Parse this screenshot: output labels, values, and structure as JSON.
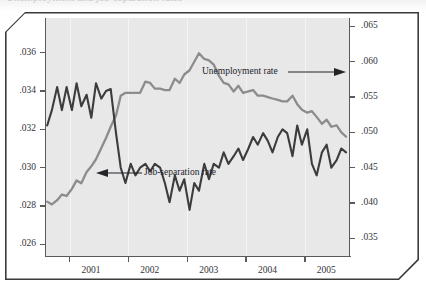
{
  "figure": {
    "clipped_caption": "Unemployment and job-separation rates"
  },
  "chart_data": {
    "type": "line",
    "title": "",
    "xlabel": "",
    "ylabel_left": "",
    "ylabel_right": "",
    "grid": "vertical",
    "legend_position": "inline-annotations",
    "x_tick_labels": [
      "2001",
      "2002",
      "2003",
      "2004",
      "2005"
    ],
    "x_tick_positions": [
      2001,
      2002,
      2003,
      2004,
      2005
    ],
    "xlim": [
      2000.6,
      2005.75
    ],
    "left_axis": {
      "tick_labels": [
        ".036",
        ".034",
        ".032",
        ".030",
        ".028",
        ".026"
      ],
      "tick_values": [
        0.036,
        0.034,
        0.032,
        0.03,
        0.028,
        0.026
      ],
      "ylim": [
        0.0254,
        0.0378
      ]
    },
    "right_axis": {
      "tick_labels": [
        ".065",
        ".060",
        ".055",
        ".050",
        ".045",
        ".040",
        ".035"
      ],
      "tick_values": [
        0.065,
        0.06,
        0.055,
        0.05,
        0.045,
        0.04,
        0.035
      ],
      "ylim": [
        0.0325,
        0.0662
      ]
    },
    "annotations": [
      {
        "text": "Unemployment rate",
        "arrow": "right"
      },
      {
        "text": "Job-separation rate",
        "arrow": "left"
      }
    ],
    "series": [
      {
        "name": "Unemployment rate",
        "axis": "right",
        "color": "#8c8c8c",
        "x": [
          2000.62,
          2000.7,
          2000.79,
          2000.87,
          2000.95,
          2001.04,
          2001.12,
          2001.2,
          2001.29,
          2001.37,
          2001.45,
          2001.54,
          2001.62,
          2001.7,
          2001.79,
          2001.87,
          2001.95,
          2002.04,
          2002.12,
          2002.2,
          2002.29,
          2002.37,
          2002.45,
          2002.54,
          2002.62,
          2002.7,
          2002.79,
          2002.87,
          2002.95,
          2003.04,
          2003.12,
          2003.2,
          2003.29,
          2003.37,
          2003.45,
          2003.54,
          2003.62,
          2003.7,
          2003.79,
          2003.87,
          2003.95,
          2004.04,
          2004.12,
          2004.2,
          2004.29,
          2004.37,
          2004.45,
          2004.54,
          2004.62,
          2004.7,
          2004.79,
          2004.87,
          2004.95,
          2005.04,
          2005.12,
          2005.2,
          2005.29,
          2005.37,
          2005.45,
          2005.54,
          2005.62,
          2005.7
        ],
        "y": [
          0.0402,
          0.0398,
          0.0404,
          0.0412,
          0.041,
          0.042,
          0.0432,
          0.0428,
          0.0444,
          0.0452,
          0.0462,
          0.0478,
          0.0492,
          0.0508,
          0.0524,
          0.0552,
          0.0556,
          0.0556,
          0.0556,
          0.0556,
          0.0572,
          0.057,
          0.0562,
          0.0562,
          0.056,
          0.056,
          0.0576,
          0.057,
          0.0582,
          0.0588,
          0.06,
          0.0612,
          0.0604,
          0.0602,
          0.0596,
          0.058,
          0.057,
          0.0568,
          0.0558,
          0.0566,
          0.0556,
          0.0558,
          0.056,
          0.0552,
          0.0552,
          0.055,
          0.0548,
          0.0546,
          0.0544,
          0.0544,
          0.0552,
          0.054,
          0.0532,
          0.0528,
          0.053,
          0.0522,
          0.0512,
          0.0518,
          0.0508,
          0.051,
          0.05,
          0.0494
        ]
      },
      {
        "name": "Job-separation rate",
        "axis": "left",
        "color": "#3c3c3c",
        "x": [
          2000.62,
          2000.7,
          2000.79,
          2000.87,
          2000.95,
          2001.04,
          2001.12,
          2001.2,
          2001.29,
          2001.37,
          2001.45,
          2001.54,
          2001.62,
          2001.7,
          2001.79,
          2001.87,
          2001.95,
          2002.04,
          2002.12,
          2002.2,
          2002.29,
          2002.37,
          2002.45,
          2002.54,
          2002.62,
          2002.7,
          2002.79,
          2002.87,
          2002.95,
          2003.04,
          2003.12,
          2003.2,
          2003.29,
          2003.37,
          2003.45,
          2003.54,
          2003.62,
          2003.7,
          2003.79,
          2003.87,
          2003.95,
          2004.04,
          2004.12,
          2004.2,
          2004.29,
          2004.37,
          2004.45,
          2004.54,
          2004.62,
          2004.7,
          2004.79,
          2004.87,
          2004.95,
          2005.04,
          2005.12,
          2005.2,
          2005.29,
          2005.37,
          2005.45,
          2005.54,
          2005.62,
          2005.7
        ],
        "y": [
          0.0322,
          0.033,
          0.0342,
          0.033,
          0.0342,
          0.033,
          0.0344,
          0.0332,
          0.0338,
          0.0326,
          0.0344,
          0.0336,
          0.034,
          0.0341,
          0.0318,
          0.03,
          0.0292,
          0.0302,
          0.0296,
          0.03,
          0.0302,
          0.0298,
          0.0302,
          0.03,
          0.0292,
          0.0282,
          0.0296,
          0.0288,
          0.0294,
          0.0278,
          0.0292,
          0.0288,
          0.0302,
          0.0294,
          0.0302,
          0.03,
          0.0308,
          0.0302,
          0.0306,
          0.031,
          0.0304,
          0.031,
          0.0316,
          0.0312,
          0.0318,
          0.0314,
          0.0308,
          0.0316,
          0.032,
          0.0318,
          0.0306,
          0.0322,
          0.0312,
          0.032,
          0.0302,
          0.0296,
          0.0308,
          0.0312,
          0.03,
          0.0304,
          0.031,
          0.0308
        ]
      }
    ]
  }
}
